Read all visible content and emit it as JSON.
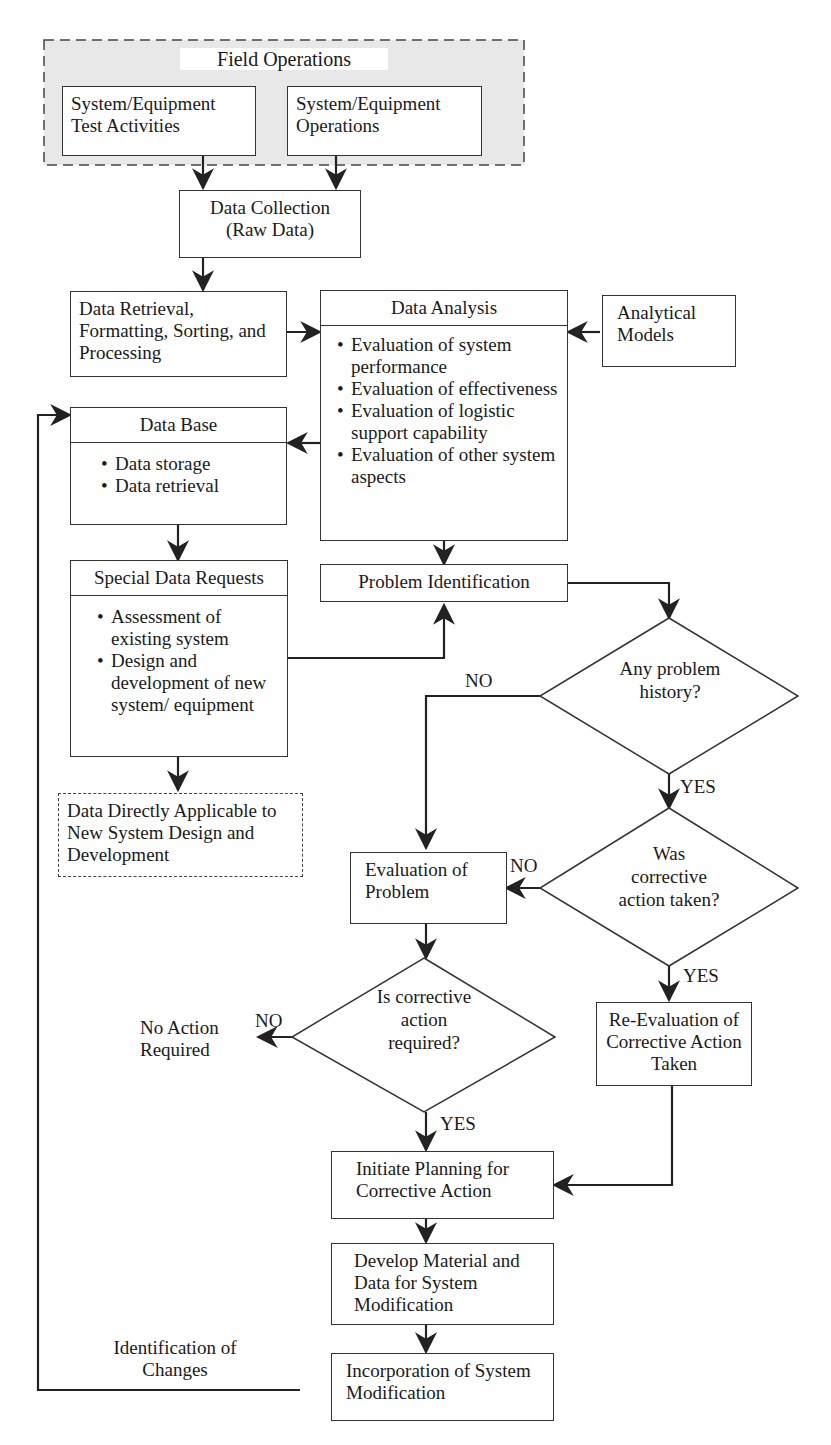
{
  "field_operations": {
    "title": "Field Operations",
    "test_activities": "System/Equipment Test Activities",
    "operations": "System/Equipment Operations"
  },
  "data_collection": "Data Collection (Raw Data)",
  "data_retrieval": "Data Retrieval, Formatting, Sorting, and Processing",
  "data_analysis": {
    "title": "Data Analysis",
    "items": [
      "Evaluation of system performance",
      "Evaluation of effectiveness",
      "Evaluation of logistic support capability",
      "Evaluation of other system aspects"
    ]
  },
  "analytical_models": "Analytical Models",
  "data_base": {
    "title": "Data Base",
    "items": [
      "Data storage",
      "Data retrieval"
    ]
  },
  "special_requests": {
    "title": "Special Data Requests",
    "items": [
      "Assessment of existing system",
      "Design and development of new system/ equipment"
    ]
  },
  "data_applicable": "Data Directly Applicable to New System Design and Development",
  "problem_identification": "Problem Identification",
  "decision_history": "Any problem history?",
  "decision_taken": "Was corrective action taken?",
  "decision_required": "Is corrective action required?",
  "evaluation_problem": "Evaluation of Problem",
  "re_evaluation": "Re-Evaluation of Corrective Action Taken",
  "no_action": "No Action Required",
  "initiate_planning": "Initiate Planning for Corrective Action",
  "develop_material": "Develop Material and Data for System Modification",
  "incorporation": "Incorporation of System Modification",
  "identification_changes": "Identification of Changes",
  "labels": {
    "no": "NO",
    "yes": "YES"
  }
}
